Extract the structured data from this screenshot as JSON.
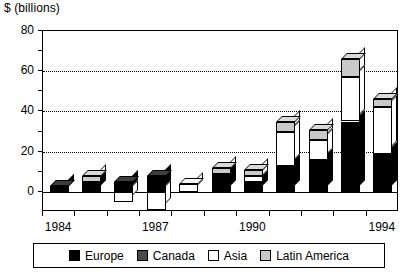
{
  "chart_data": {
    "type": "bar",
    "title": "",
    "ylabel": "$ (billions)",
    "xlabel": "",
    "ylim": [
      -10,
      80
    ],
    "yticks": [
      0,
      20,
      40,
      60,
      80
    ],
    "gridlines": [
      20,
      40,
      60
    ],
    "grid": true,
    "stacked": true,
    "style": "3d-isometric",
    "legend_position": "bottom",
    "categories": [
      "1984",
      "1985",
      "1986",
      "1987",
      "1988",
      "1989",
      "1990",
      "1991",
      "1992",
      "1993",
      "1994"
    ],
    "xtick_labels": [
      "1984",
      "",
      "",
      "1987",
      "",
      "",
      "1990",
      "",
      "",
      "",
      "1994"
    ],
    "series": [
      {
        "name": "Europe",
        "color": "#000000",
        "values": [
          3,
          5,
          5,
          8,
          0,
          9,
          5,
          13,
          16,
          35,
          19
        ]
      },
      {
        "name": "Canada",
        "color": "#4a4a4a",
        "values": [
          0,
          0,
          0,
          0,
          0,
          0,
          0,
          0,
          0,
          0,
          0
        ]
      },
      {
        "name": "Asia",
        "color": "#ffffff",
        "values": [
          0,
          0,
          -5,
          -9,
          4,
          0,
          3,
          17,
          10,
          22,
          23
        ]
      },
      {
        "name": "Latin America",
        "color": "#c9c9c9",
        "values": [
          0,
          3,
          0,
          0,
          0,
          3,
          3,
          5,
          5,
          9,
          4
        ]
      }
    ],
    "totals": [
      3,
      8,
      5,
      8,
      4,
      12,
      11,
      35,
      31,
      66,
      46
    ]
  },
  "legend": {
    "items": [
      {
        "label": "Europe",
        "color": "#000000"
      },
      {
        "label": "Canada",
        "color": "#4a4a4a"
      },
      {
        "label": "Asia",
        "color": "#ffffff"
      },
      {
        "label": "Latin America",
        "color": "#c9c9c9"
      }
    ]
  }
}
